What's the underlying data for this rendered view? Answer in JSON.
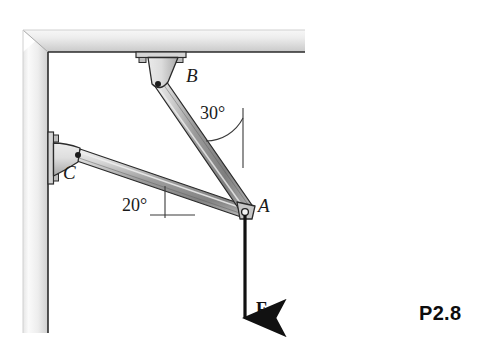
{
  "figure": {
    "problem_label": "P2.8",
    "joints": [
      {
        "id": "A",
        "label": "A",
        "x": 245,
        "y": 212,
        "type": "pin-joint",
        "label_x": 258,
        "label_y": 204
      },
      {
        "id": "B",
        "label": "B",
        "x": 158,
        "y": 84,
        "type": "pin-joint",
        "label_x": 186,
        "label_y": 74
      },
      {
        "id": "C",
        "label": "C",
        "x": 78,
        "y": 155,
        "type": "pin-joint",
        "label_x": 67,
        "label_y": 170
      }
    ],
    "members": [
      {
        "id": "AB",
        "from": "B",
        "to": "A",
        "angle_label": "30°",
        "angle_ref": "vertical"
      },
      {
        "id": "CA",
        "from": "C",
        "to": "A",
        "angle_label": "20°",
        "angle_ref": "horizontal"
      }
    ],
    "angles": [
      {
        "id": "angle-30",
        "text": "30°",
        "value": 30,
        "unit": "degrees",
        "reference": "vertical",
        "label_x": 200,
        "label_y": 105
      },
      {
        "id": "angle-20",
        "text": "20°",
        "value": 20,
        "unit": "degrees",
        "reference": "horizontal",
        "label_x": 124,
        "label_y": 197
      }
    ],
    "force": {
      "label": "F",
      "direction": "down",
      "applied_at": "A",
      "tail_x": 245,
      "tail_y": 215,
      "head_x": 245,
      "head_y": 322,
      "label_x": 256,
      "label_y": 309
    },
    "supports": {
      "ceiling": {
        "name": "ceiling",
        "bracket": "ceiling-bracket-B",
        "bolts": 2
      },
      "wall": {
        "name": "wall",
        "bracket": "wall-bracket-C",
        "bolts": 2
      }
    },
    "colors": {
      "line": "#1a1a1a",
      "member_light": "#e8e8e8",
      "member_mid": "#b8b8b8",
      "member_dark": "#6f6f6f",
      "wall_light": "#f2f2f2",
      "wall_mid": "#d8d8d8",
      "wall_dark": "#bcbcbc",
      "bracket_light": "#e2e2e2",
      "bracket_dark": "#9c9c9c",
      "force": "#111111",
      "background": "#ffffff"
    }
  }
}
